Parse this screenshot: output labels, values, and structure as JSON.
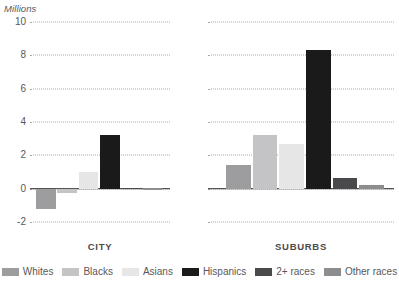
{
  "chart_data": {
    "type": "bar",
    "title": "",
    "subtitle": "",
    "unit_label": "Millions",
    "xlabel": "",
    "ylabel": "Millions",
    "ylim": [
      -2,
      10
    ],
    "yticks": [
      -2,
      0,
      2,
      4,
      6,
      8,
      10
    ],
    "ytick_labels": [
      "-2",
      "0",
      "2",
      "4",
      "6",
      "8",
      "10"
    ],
    "grid": true,
    "grid_style": "dotted-horizontal",
    "legend_position": "bottom",
    "panels": [
      "CITY",
      "SUBURBS"
    ],
    "categories": [
      "Whites",
      "Blacks",
      "Asians",
      "Hispanics",
      "2+ races",
      "Other races"
    ],
    "series": [
      {
        "name": "CITY",
        "values": [
          -1.2,
          -0.25,
          1.0,
          3.2,
          0.05,
          0.02
        ]
      },
      {
        "name": "SUBURBS",
        "values": [
          1.45,
          3.2,
          2.7,
          8.3,
          0.65,
          0.2
        ]
      }
    ],
    "colors": {
      "Whites": "#9d9d9f",
      "Blacks": "#c4c4c6",
      "Asians": "#e6e6e7",
      "Hispanics": "#1a1a1a",
      "2+ races": "#4a4a4c",
      "Other races": "#8d8d8f"
    },
    "axis_color": "#303031",
    "grid_color": "#a8a8aa",
    "text_color": "#58585a"
  },
  "legend": {
    "items": [
      {
        "label": "Whites",
        "color": "#9d9d9f"
      },
      {
        "label": "Blacks",
        "color": "#c4c4c6"
      },
      {
        "label": "Asians",
        "color": "#e6e6e7"
      },
      {
        "label": "Hispanics",
        "color": "#1a1a1a"
      },
      {
        "label": "2+ races",
        "color": "#4a4a4c"
      },
      {
        "label": "Other races",
        "color": "#8d8d8f"
      }
    ]
  }
}
